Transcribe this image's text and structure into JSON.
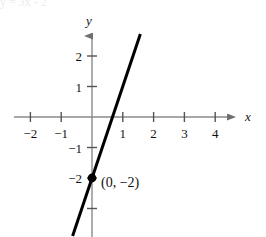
{
  "figure": {
    "width": 266,
    "height": 237,
    "background_color": "#ffffff",
    "clipped_top_text": "y = 3x - 2"
  },
  "chart_data": {
    "type": "line",
    "title": "",
    "subtitle": "",
    "xlabel": "x",
    "ylabel": "y",
    "xlim": [
      -2.6,
      4.6
    ],
    "ylim": [
      -3.2,
      2.6
    ],
    "grid": false,
    "legend": null,
    "equation": "y = 3x - 2",
    "slope": 3,
    "y_intercept": -2,
    "series": [
      {
        "name": "y = 3x - 2",
        "color": "#000000",
        "line_width": 3,
        "x": [
          -0.63,
          1.57
        ],
        "y": [
          -3.9,
          2.72
        ]
      }
    ],
    "points": [
      {
        "name": "y-intercept",
        "x": 0,
        "y": -2,
        "label": "(0, −2)",
        "marker": "filled-circle",
        "color": "#000000"
      }
    ],
    "x_ticks": [
      -2,
      -1,
      1,
      2,
      3,
      4
    ],
    "x_tick_labels": [
      "−2",
      "−1",
      "1",
      "2",
      "3",
      "4"
    ],
    "y_ticks": [
      2,
      1,
      -1,
      -2
    ],
    "y_tick_labels": [
      "2",
      "1",
      "−1",
      "−2"
    ],
    "y_unlabeled_ticks": [
      -3
    ],
    "axis_color": "#8a8a8a",
    "tick_color": "#555555",
    "text_color": "#111111"
  }
}
